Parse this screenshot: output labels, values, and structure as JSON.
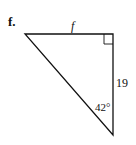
{
  "problem": {
    "label": "f.",
    "figure": "right-triangle",
    "sides": {
      "top": "f",
      "right": "19"
    },
    "angles": {
      "bottom": "42°",
      "top_right": "right-angle"
    }
  }
}
